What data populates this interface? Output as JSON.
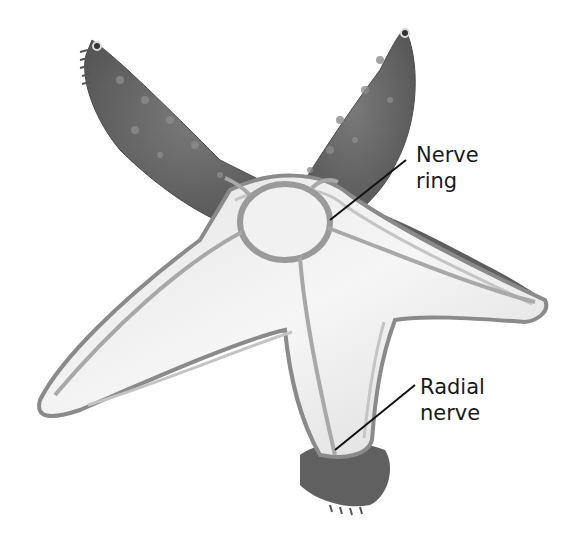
{
  "figure": {
    "colors": {
      "background": "#ffffff",
      "skin": "#6e6e6e",
      "skin_dark": "#545454",
      "interior": "#efefef",
      "interior_edge": "#bdbdbd",
      "nerve": "#b0b0b0",
      "leader_line": "#111111",
      "label_text": "#1a1a1a"
    }
  },
  "labels": {
    "nerve_ring": {
      "line1": "Nerve",
      "line2": "ring"
    },
    "radial_nerve": {
      "line1": "Radial",
      "line2": "nerve"
    }
  }
}
